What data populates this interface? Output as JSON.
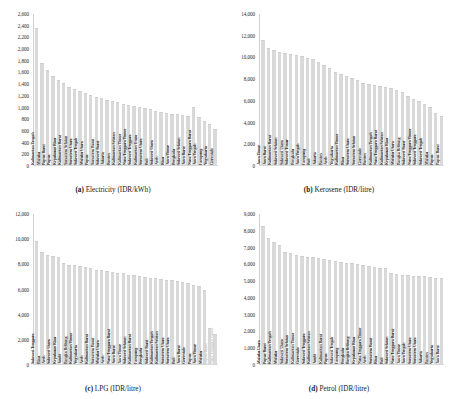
{
  "figure": {
    "panels": [
      {
        "id": "a",
        "caption_prefix": "(a)",
        "caption_text": "Electricity (IDR/kWh)"
      },
      {
        "id": "b",
        "caption_prefix": "(b)",
        "caption_text": "Kerosene (IDR/litre)"
      },
      {
        "id": "c",
        "caption_prefix": "(c)",
        "caption_text": "LPG (IDR/litre)"
      },
      {
        "id": "d",
        "caption_prefix": "(d)",
        "caption_text": "Petrol (IDR/litre)"
      }
    ]
  },
  "chart_data": [
    {
      "type": "bar",
      "panel": "a",
      "title": "(a) Electricity (IDR/kWh)",
      "xlabel": "",
      "ylabel": "",
      "ylim": [
        0,
        2600
      ],
      "yticks": [
        0,
        200,
        400,
        600,
        800,
        1000,
        1200,
        1400,
        1600,
        1800,
        2000,
        2200,
        2400,
        2600
      ],
      "ytick_labels": [
        "0",
        "200",
        "400",
        "600",
        "800",
        "1,000",
        "1,200",
        "1,400",
        "1,600",
        "1,800",
        "2,000",
        "2,200",
        "2,400",
        "2,600"
      ],
      "grid": false,
      "legend": "none",
      "categories": [
        "Kalimantan Tengah",
        "Maluku",
        "Papua Barat",
        "Papua",
        "Kepulauan Riau",
        "Kalimantan Barat",
        "Sumatera Selatan",
        "Sumatera Utara",
        "Sulawesi Tengah",
        "Maluku Utara",
        "Papua",
        "Sumatera Barat",
        "Sulawesi Barat",
        "Jakarta",
        "Banten",
        "Kalimantan Selatan",
        "Kalimantan Timur",
        "Nusa Tenggara Timur",
        "Sulawesi Tenggara",
        "Kalimantan Utara",
        "Sumatera Utara",
        "Bali",
        "Sulawesi Utara",
        "Aceh",
        "Riau",
        "Jawa Timur",
        "Bengkulu",
        "Sulawesi Selatan",
        "Jawa Barat",
        "Nusa Tenggara Barat",
        "Jawa Tengah",
        "Lampung",
        "Yogyakarta",
        "Gorontalo"
      ],
      "values": [
        2350,
        1750,
        1620,
        1520,
        1460,
        1400,
        1340,
        1300,
        1270,
        1240,
        1200,
        1170,
        1140,
        1110,
        1090,
        1070,
        1050,
        1030,
        1010,
        990,
        970,
        950,
        930,
        910,
        890,
        880,
        865,
        850,
        840,
        1000,
        820,
        760,
        700,
        620
      ]
    },
    {
      "type": "bar",
      "panel": "b",
      "title": "(b) Kerosene (IDR/litre)",
      "xlabel": "",
      "ylabel": "",
      "ylim": [
        0,
        14000
      ],
      "yticks": [
        0,
        2000,
        4000,
        6000,
        8000,
        10000,
        12000,
        14000
      ],
      "ytick_labels": [
        "0",
        "2,000",
        "4,000",
        "6,000",
        "8,000",
        "10,000",
        "12,000",
        "14,000"
      ],
      "grid": false,
      "legend": "none",
      "categories": [
        "Jawa Timur",
        "Jawa Barat",
        "Kalimantan Barat",
        "Sulawesi Selatan",
        "Sulawesi Utara",
        "Sulawesi Timur",
        "Bengkulu",
        "Jawa Tengah",
        "Lampung",
        "Bali",
        "Jakarta",
        "Banten",
        "Aceh",
        "Yogyakarta",
        "Kalimantan Timur",
        "Riau",
        "Sumatera Utara",
        "Sumatera Selatan",
        "Gorontalo",
        "Banten",
        "Kalimantan Tengah",
        "Nusa Tenggara Barat",
        "Kalimantan Selatan",
        "Kepulauan Riau",
        "Maluku Utara",
        "Bangka Belitung",
        "Sulawesi Barat",
        "Nusa Tenggara Timur",
        "Sulawesi Tenggara",
        "Sulawesi Tengah",
        "Maluku",
        "Papua",
        "Papua Barat"
      ],
      "values": [
        11500,
        10800,
        10600,
        10400,
        10300,
        10200,
        10100,
        10000,
        9900,
        9800,
        9500,
        9200,
        8900,
        8600,
        8400,
        8200,
        8000,
        7800,
        7600,
        7500,
        7400,
        7300,
        7200,
        7100,
        6900,
        6700,
        6400,
        6100,
        5900,
        5600,
        5300,
        4800,
        4500
      ]
    },
    {
      "type": "bar",
      "panel": "c",
      "title": "(c) LPG (IDR/litre)",
      "xlabel": "",
      "ylabel": "",
      "ylim": [
        0,
        12000
      ],
      "yticks": [
        0,
        2000,
        4000,
        6000,
        8000,
        10000,
        12000
      ],
      "ytick_labels": [
        "0",
        "2,000",
        "4,000",
        "6,000",
        "8,000",
        "10,000",
        "12,000"
      ],
      "grid": false,
      "legend": "none",
      "categories": [
        "Sulawesi Tenggara",
        "Riau",
        "Aceh",
        "Sulawesi Utara",
        "Kepulauan Riau",
        "Jambi",
        "Bangka Belitung",
        "Kalimantan Timur",
        "Yogyakarta",
        "Aceh",
        "Kalimantan Barat",
        "Sumatera Barat",
        "Maluku Utara",
        "Aceh",
        "Nusa Tenggara Barat",
        "Jawa Barat",
        "Jawa Timur",
        "Sulawesi Selatan",
        "Kalimantan Barat",
        "Lampung",
        "Bengkulu",
        "Sulawesi Barat",
        "Kalimantan Tengah",
        "Kalimantan Selatan",
        "Sumatera Utara",
        "Sumatera Utara",
        "Bali",
        "Jawa Barat",
        "Gorontalo",
        "Papua",
        "Jawa Timur",
        "Maluku",
        "Papua Barat",
        "Nusa Tenggara Timur"
      ],
      "values": [
        9800,
        8900,
        8700,
        8600,
        8500,
        8000,
        7900,
        7850,
        7800,
        7700,
        7600,
        7500,
        7450,
        7400,
        7300,
        7250,
        7200,
        7100,
        7050,
        7000,
        6900,
        6850,
        6800,
        6750,
        6700,
        6650,
        6600,
        6500,
        6400,
        6300,
        6200,
        5900,
        2900,
        2400
      ]
    },
    {
      "type": "bar",
      "panel": "d",
      "title": "(d) Petrol (IDR/litre)",
      "xlabel": "",
      "ylabel": "",
      "ylim": [
        0,
        9000
      ],
      "yticks": [
        0,
        1000,
        2000,
        3000,
        4000,
        5000,
        6000,
        7000,
        8000,
        9000
      ],
      "ytick_labels": [
        "0",
        "1,000",
        "2,000",
        "3,000",
        "4,000",
        "5,000",
        "6,000",
        "7,000",
        "8,000",
        "9,000"
      ],
      "grid": false,
      "legend": "none",
      "categories": [
        "Maluku Utara",
        "Papua Barat",
        "Kalimantan Tengah",
        "Maluku",
        "Sulawesi Utara",
        "Sumatera Selatan",
        "Kalimantan Timur",
        "Gorontalo",
        "Sulawesi Tenggara",
        "Kalimantan Selatan",
        "Jambi",
        "Kalimantan Barat",
        "Papua",
        "Sulawesi Tengah",
        "Lampung",
        "Bengkulu",
        "Bangka Belitung",
        "Kepulauan Riau",
        "Nusa Tenggara Timur",
        "Aceh",
        "Sumatera Barat",
        "Riau",
        "Bali",
        "Sulawesi Selatan",
        "Nusa Tenggara Barat",
        "Jawa Timur",
        "Jawa Tengah",
        "Sumatera Utara",
        "Sumatera Utara",
        "Jakarta",
        "Banten",
        "Yogyakarta",
        "Jawa Barat"
      ],
      "values": [
        8200,
        7500,
        7300,
        7100,
        6700,
        6600,
        6500,
        6450,
        6400,
        6350,
        6300,
        6250,
        6200,
        6150,
        6100,
        6050,
        6000,
        5950,
        5900,
        5850,
        5800,
        5750,
        5700,
        5400,
        5350,
        5300,
        5280,
        5260,
        5240,
        5220,
        5200,
        5150,
        5100
      ]
    }
  ]
}
